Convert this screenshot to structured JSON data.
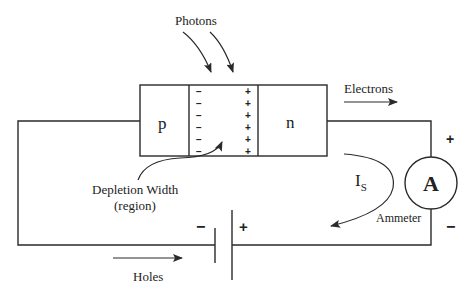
{
  "diagram": {
    "labels": {
      "photons": "Photons",
      "p_region": "p",
      "n_region": "n",
      "electrons": "Electrons",
      "holes": "Holes",
      "depletion_line1": "Depletion Width",
      "depletion_line2": "(region)",
      "current": "I",
      "current_sub": "S",
      "ammeter_symbol": "A",
      "ammeter": "Ammeter",
      "battery_minus": "−",
      "battery_plus": "+",
      "ammeter_plus": "+",
      "ammeter_minus": "−"
    },
    "depletion_charges": {
      "negative": [
        "−",
        "−",
        "−",
        "−",
        "−",
        "−"
      ],
      "positive": [
        "+",
        "+",
        "+",
        "+",
        "+",
        "+"
      ]
    },
    "colors": {
      "line": "#2a2a2a",
      "text": "#222222",
      "background": "#ffffff"
    }
  }
}
